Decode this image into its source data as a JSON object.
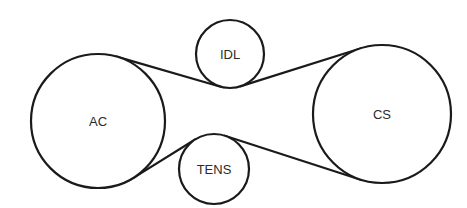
{
  "diagram": {
    "type": "belt-routing",
    "colors": {
      "stroke": "#1a1a1a",
      "text": "#2a2a2a",
      "background": "#ffffff"
    },
    "pulleys": [
      {
        "id": "ac",
        "label": "AC",
        "cx": 98,
        "cy": 121,
        "r": 67
      },
      {
        "id": "idl",
        "label": "IDL",
        "cx": 230,
        "cy": 54,
        "r": 34
      },
      {
        "id": "tens",
        "label": "TENS",
        "cx": 214,
        "cy": 169,
        "r": 35
      },
      {
        "id": "cs",
        "label": "CS",
        "cx": 382,
        "cy": 114,
        "r": 69
      }
    ],
    "belt_segments": [
      {
        "from": "ac",
        "from_side": "top",
        "to": "idl",
        "to_side": "bottom"
      },
      {
        "from": "idl",
        "from_side": "bottom",
        "to": "cs",
        "to_side": "top"
      },
      {
        "from": "ac",
        "from_side": "bottom",
        "to": "tens",
        "to_side": "top"
      },
      {
        "from": "tens",
        "from_side": "top",
        "to": "cs",
        "to_side": "bottom"
      }
    ]
  }
}
